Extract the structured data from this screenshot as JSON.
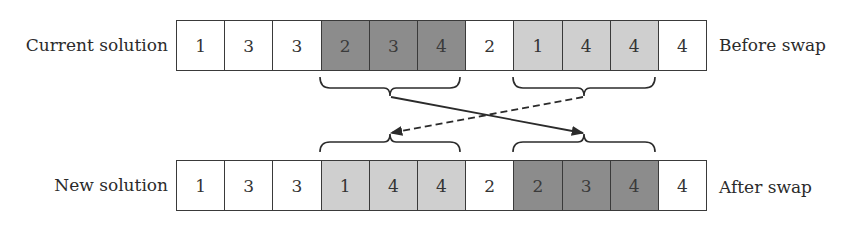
{
  "diagram": {
    "colors": {
      "dark_segment": "#8c8c8c",
      "light_segment": "#cfcfcf",
      "plain": "#ffffff",
      "line": "#2b2b2b"
    },
    "rows": [
      {
        "left_label": "Current solution",
        "right_label": "Before swap",
        "cells": [
          {
            "value": "1",
            "shade": "white"
          },
          {
            "value": "3",
            "shade": "white"
          },
          {
            "value": "3",
            "shade": "white"
          },
          {
            "value": "2",
            "shade": "dark"
          },
          {
            "value": "3",
            "shade": "dark"
          },
          {
            "value": "4",
            "shade": "dark"
          },
          {
            "value": "2",
            "shade": "white"
          },
          {
            "value": "1",
            "shade": "light"
          },
          {
            "value": "4",
            "shade": "light"
          },
          {
            "value": "4",
            "shade": "light"
          },
          {
            "value": "4",
            "shade": "white"
          }
        ]
      },
      {
        "left_label": "New solution",
        "right_label": "After swap",
        "cells": [
          {
            "value": "1",
            "shade": "white"
          },
          {
            "value": "3",
            "shade": "white"
          },
          {
            "value": "3",
            "shade": "white"
          },
          {
            "value": "1",
            "shade": "light"
          },
          {
            "value": "4",
            "shade": "light"
          },
          {
            "value": "4",
            "shade": "light"
          },
          {
            "value": "2",
            "shade": "white"
          },
          {
            "value": "2",
            "shade": "dark"
          },
          {
            "value": "3",
            "shade": "dark"
          },
          {
            "value": "4",
            "shade": "dark"
          },
          {
            "value": "4",
            "shade": "white"
          }
        ]
      }
    ],
    "edges": [
      {
        "from": "top segment cells 4-6 (dark)",
        "to": "bottom segment cells 8-10",
        "style": "solid",
        "arrow": "end"
      },
      {
        "from": "top segment cells 8-10 (light)",
        "to": "bottom segment cells 4-6",
        "style": "dashed",
        "arrow": "end"
      }
    ]
  }
}
